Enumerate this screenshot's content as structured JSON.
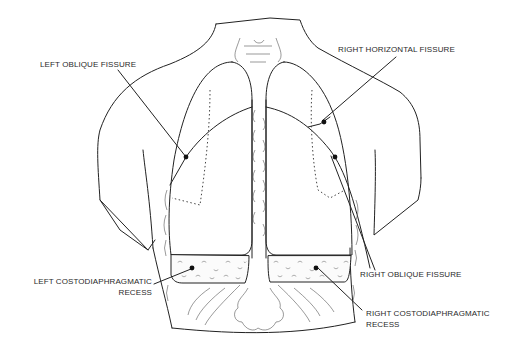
{
  "diagram": {
    "colors": {
      "line": "#222222",
      "background": "#ffffff",
      "stipple": "#666666"
    },
    "labels": [
      {
        "id": "left-oblique-fissure",
        "text": "LEFT OBLIQUE FISSURE"
      },
      {
        "id": "right-horizontal-fissure",
        "text": "RIGHT HORIZONTAL FISSURE"
      },
      {
        "id": "right-oblique-fissure",
        "text": "RIGHT OBLIQUE FISSURE"
      },
      {
        "id": "left-costodiaphragmatic-recess",
        "line1": "LEFT COSTODIAPHRAGMATIC",
        "line2": "RECESS"
      },
      {
        "id": "right-costodiaphragmatic-recess",
        "line1": "RIGHT COSTODIAPHRAGMATIC",
        "line2": "RECESS"
      }
    ]
  }
}
